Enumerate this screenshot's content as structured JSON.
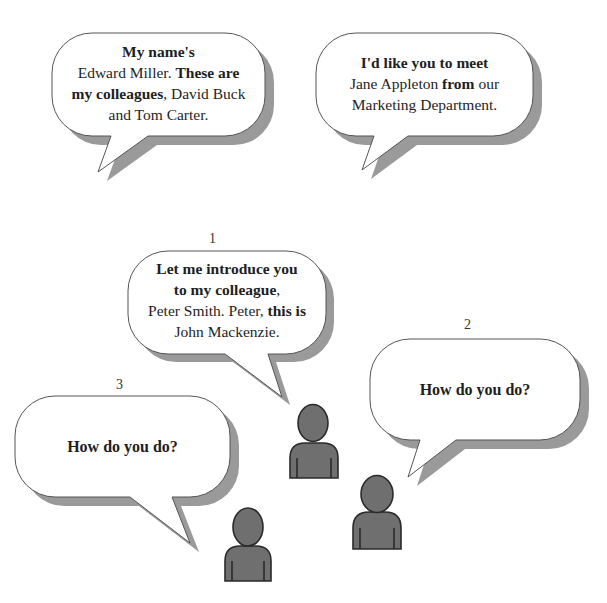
{
  "colors": {
    "bubble_fill": "#ffffff",
    "bubble_stroke": "#555555",
    "shadow": "#9a9a9a",
    "person_fill": "#6f6f6f",
    "person_stroke": "#2a2a2a"
  },
  "bubbles": [
    {
      "id": "top-left",
      "label": "",
      "lines": [
        [
          {
            "t": "My name's",
            "b": true
          }
        ],
        [
          {
            "t": "Edward Miller. ",
            "b": false
          },
          {
            "t": "These are",
            "b": true
          }
        ],
        [
          {
            "t": "my colleagues",
            "b": true
          },
          {
            "t": ", David Buck",
            "b": false
          }
        ],
        [
          {
            "t": "and Tom Carter.",
            "b": false
          }
        ]
      ]
    },
    {
      "id": "top-right",
      "label": "",
      "lines": [
        [
          {
            "t": "I'd like you to meet",
            "b": true
          }
        ],
        [
          {
            "t": "Jane Appleton ",
            "b": false
          },
          {
            "t": "from",
            "b": true
          },
          {
            "t": " our",
            "b": false
          }
        ],
        [
          {
            "t": "Marketing Department.",
            "b": false
          }
        ]
      ]
    },
    {
      "id": "one",
      "label": "1",
      "lines": [
        [
          {
            "t": "Let me introduce you",
            "b": true
          }
        ],
        [
          {
            "t": "to my colleague",
            "b": true
          },
          {
            "t": ",",
            "b": false
          }
        ],
        [
          {
            "t": "Peter Smith. Peter, ",
            "b": false
          },
          {
            "t": "this is",
            "b": true
          }
        ],
        [
          {
            "t": "John Mackenzie.",
            "b": false
          }
        ]
      ]
    },
    {
      "id": "two",
      "label": "2",
      "lines": [
        [
          {
            "t": "How do you do?",
            "b": true
          }
        ]
      ]
    },
    {
      "id": "three",
      "label": "3",
      "lines": [
        [
          {
            "t": "How do you do?",
            "b": true
          }
        ]
      ]
    }
  ],
  "people": [
    {
      "id": "person-1"
    },
    {
      "id": "person-2"
    },
    {
      "id": "person-3"
    }
  ]
}
